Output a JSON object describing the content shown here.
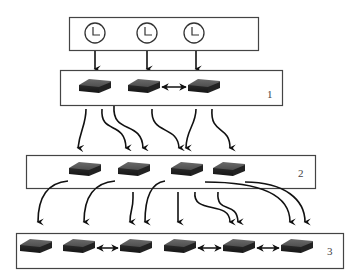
{
  "diagram": {
    "clock_layer": {
      "clocks": 3
    },
    "layers": [
      {
        "label": "1",
        "nodes": 3
      },
      {
        "label": "2",
        "nodes": 4
      },
      {
        "label": "3",
        "nodes": 6
      }
    ],
    "colors": {
      "line": "#222222",
      "box_border": "#444444",
      "device": "#3a3a3a"
    }
  }
}
